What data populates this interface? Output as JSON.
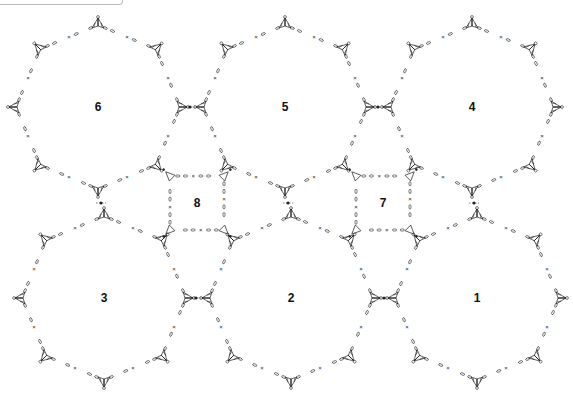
{
  "diagram": {
    "type": "crochet-join-chart",
    "stroke_color": "#222222",
    "background": "#ffffff",
    "octagons": [
      {
        "label": "6",
        "cx": 98,
        "cy": 107
      },
      {
        "label": "5",
        "cx": 285,
        "cy": 107
      },
      {
        "label": "4",
        "cx": 472,
        "cy": 107
      },
      {
        "label": "3",
        "cx": 104,
        "cy": 298
      },
      {
        "label": "2",
        "cx": 291,
        "cy": 298
      },
      {
        "label": "1",
        "cx": 477,
        "cy": 298
      }
    ],
    "squares": [
      {
        "label": "8",
        "cx": 197,
        "cy": 203
      },
      {
        "label": "7",
        "cx": 383,
        "cy": 203
      }
    ],
    "octagon_radius": 82,
    "square_half": 27,
    "symbols": {
      "fan": "triangular shell/fan motif at each octagon vertex",
      "chain": "∞ chain stitches",
      "single_crochet": "×",
      "slip_stitch": "•"
    }
  }
}
